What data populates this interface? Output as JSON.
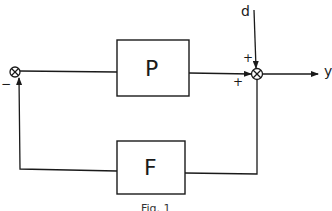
{
  "diagram": {
    "type": "feedback-control-block-diagram",
    "caption": "Fig. 1",
    "blocks": [
      {
        "id": "P",
        "label": "P",
        "position": "forward-path"
      },
      {
        "id": "F",
        "label": "F",
        "position": "feedback-path"
      }
    ],
    "summing_junctions": [
      {
        "id": "left",
        "signs": [
          "-"
        ]
      },
      {
        "id": "right",
        "signs": [
          "+",
          "+"
        ]
      }
    ],
    "signals": {
      "disturbance": "d",
      "output": "y"
    },
    "signs": {
      "left_minus": "−",
      "right_top_plus": "+",
      "right_left_plus": "+"
    },
    "colors": {
      "stroke": "#1a1a1a",
      "background": "#ffffff"
    }
  }
}
